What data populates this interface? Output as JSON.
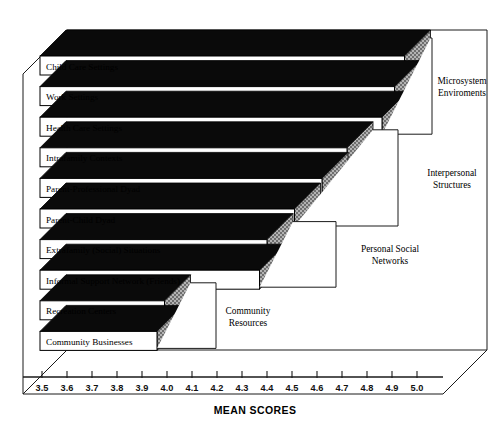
{
  "chart_data": {
    "type": "bar",
    "orientation": "horizontal",
    "title": "",
    "xlabel": "MEAN SCORES",
    "ylabel": "",
    "xlim": [
      3.5,
      5.0
    ],
    "grid": false,
    "legend": "none",
    "style": "3d-horizontal-bars",
    "categories": [
      "Child Care Settings",
      "Work Settings",
      "Health Care Settings",
      "Intrafamily Contexts",
      "Parent-Professional Dyad",
      "Parent-Child Dyad",
      "Extrafamily (Social) Situations",
      "Informal Support Network (Friends)",
      "Recreation Centers",
      "Community Businesses"
    ],
    "values": [
      4.85,
      4.81,
      4.76,
      4.62,
      4.52,
      4.41,
      4.3,
      4.27,
      3.89,
      3.86
    ],
    "tick_labels": [
      "3.5",
      "3.6",
      "3.7",
      "3.8",
      "3.9",
      "4.0",
      "4.1",
      "4.2",
      "4.3",
      "4.4",
      "4.5",
      "4.6",
      "4.7",
      "4.8",
      "4.9",
      "5.0"
    ],
    "tick_values": [
      3.5,
      3.6,
      3.7,
      3.8,
      3.9,
      4.0,
      4.1,
      4.2,
      4.3,
      4.4,
      4.5,
      4.6,
      4.7,
      4.8,
      4.9,
      5.0
    ],
    "groups": [
      {
        "label_line1": "Microsystem",
        "label_line2": "Enviroments",
        "members": [
          "Child Care Settings",
          "Work Settings",
          "Health Care Settings"
        ]
      },
      {
        "label_line1": "Interpersonal",
        "label_line2": "Structures",
        "members": [
          "Intrafamily Contexts",
          "Parent-Professional Dyad",
          "Parent-Child Dyad"
        ]
      },
      {
        "label_line1": "Personal Social",
        "label_line2": "Networks",
        "members": [
          "Extrafamily (Social) Situations",
          "Informal Support Network (Friends)"
        ]
      },
      {
        "label_line1": "Community",
        "label_line2": "Resources",
        "members": [
          "Recreation Centers",
          "Community Businesses"
        ]
      }
    ],
    "colors": {
      "bar_front": "#ffffff",
      "bar_top": "#0a0a0a",
      "bar_side": "#9a9a9a",
      "outline": "#000000",
      "background": "#ffffff"
    }
  }
}
